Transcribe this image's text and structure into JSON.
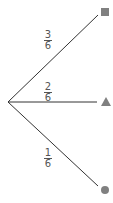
{
  "diagram": {
    "type": "probability-tree",
    "root": {
      "x": 8,
      "y": 102
    },
    "colors": {
      "line": "#333333",
      "marker": "#808080",
      "text": "#555555"
    },
    "branches": [
      {
        "outcome": "square",
        "probability": {
          "numerator": "3",
          "denominator": "6"
        },
        "end": {
          "x": 100,
          "y": 12
        }
      },
      {
        "outcome": "triangle",
        "probability": {
          "numerator": "2",
          "denominator": "6"
        },
        "end": {
          "x": 98,
          "y": 102
        }
      },
      {
        "outcome": "circle",
        "probability": {
          "numerator": "1",
          "denominator": "6"
        },
        "end": {
          "x": 100,
          "y": 188
        }
      }
    ]
  }
}
